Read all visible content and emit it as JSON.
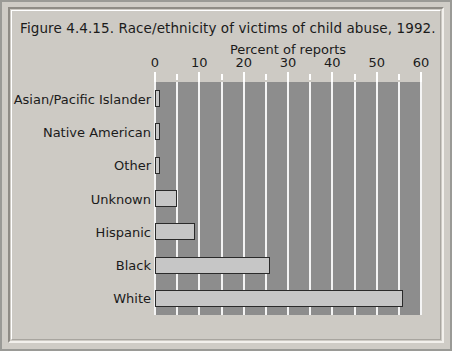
{
  "figure": {
    "title": "Figure 4.4.15. Race/ethnicity of victims of child abuse, 1992."
  },
  "chart_data": {
    "type": "bar",
    "orientation": "horizontal",
    "title": "Figure 4.4.15. Race/ethnicity of victims of child abuse, 1992.",
    "xlabel": "Percent of reports",
    "ylabel": "",
    "categories": [
      "Asian/Pacific Islander",
      "Native American",
      "Other",
      "Unknown",
      "Hispanic",
      "Black",
      "White"
    ],
    "values": [
      1,
      1,
      1,
      5,
      9,
      26,
      56
    ],
    "xlim": [
      0,
      60
    ],
    "xticks": [
      0,
      10,
      20,
      30,
      40,
      50,
      60
    ],
    "xticklabels": [
      "0",
      "10",
      "20",
      "30",
      "40",
      "50",
      "60"
    ],
    "gridlines": [
      0,
      5,
      10,
      15,
      20,
      25,
      30,
      35,
      40,
      45,
      50,
      55,
      60
    ],
    "grid": true,
    "legend": "none",
    "colors": {
      "bar_fill": "#c6c6c6",
      "bar_edge": "#2a2a2a",
      "plot_background": "#8d8d8d",
      "gridline": "#f4f4f4",
      "figure_background": "#cdcac4",
      "text": "#1b1b1b"
    }
  }
}
